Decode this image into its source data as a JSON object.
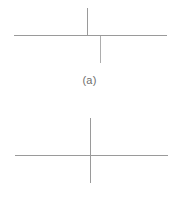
{
  "figure": {
    "background_color": "#ffffff",
    "line_color": "#9a9a9a",
    "line_color_faint": "#adadad",
    "caption_color": "#6e6e6e",
    "panels": [
      {
        "id": "a",
        "caption": "(a)",
        "description": "horizontal line crossed by a vertical line whose upper and lower segments are laterally offset (misaligned junction)",
        "horizontal_line": {
          "x1": 14,
          "y1": 35,
          "x2": 167,
          "y2": 35,
          "stroke_width": 1
        },
        "vertical_segments": [
          {
            "name": "upper-segment",
            "x1": 87,
            "y1": 8,
            "x2": 87,
            "y2": 36,
            "stroke_width": 1
          },
          {
            "name": "lower-segment",
            "x1": 100,
            "y1": 36,
            "x2": 100,
            "y2": 63,
            "stroke_width": 1
          }
        ],
        "offset_px": 13,
        "aligned": false
      },
      {
        "id": "b",
        "caption": "(b)",
        "description": "horizontal line crossed by a single continuous, aligned vertical line forming a clean cross",
        "horizontal_line": {
          "x1": 15,
          "y1": 51,
          "x2": 168,
          "y2": 51,
          "stroke_width": 1
        },
        "vertical_segments": [
          {
            "name": "full-segment",
            "x1": 90,
            "y1": 14,
            "x2": 90,
            "y2": 79,
            "stroke_width": 1
          }
        ],
        "offset_px": 0,
        "aligned": true
      }
    ]
  }
}
